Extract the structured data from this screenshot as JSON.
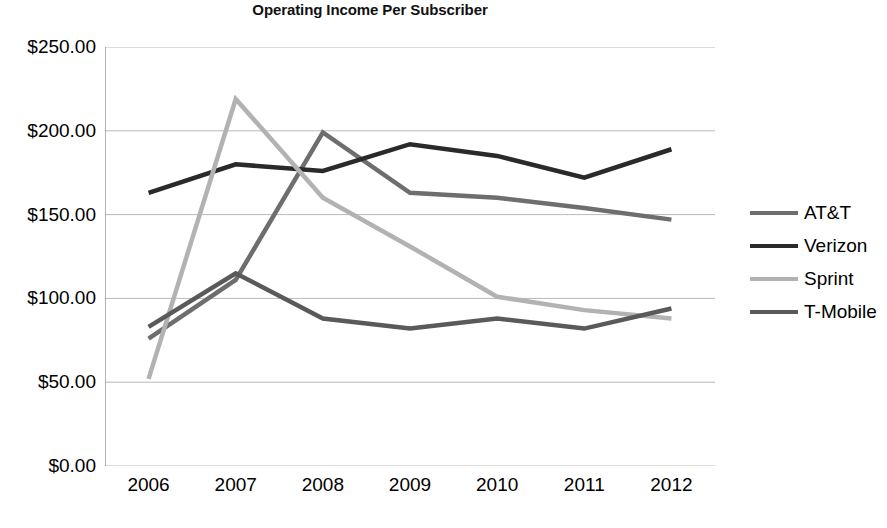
{
  "chart_data": {
    "type": "line",
    "title": "Operating Income Per Subscriber",
    "xlabel": "",
    "ylabel": "",
    "categories": [
      "2006",
      "2007",
      "2008",
      "2009",
      "2010",
      "2011",
      "2012"
    ],
    "x": [
      2006,
      2007,
      2008,
      2009,
      2010,
      2011,
      2012
    ],
    "ylim": [
      0,
      250
    ],
    "ytick_values": [
      0,
      50,
      100,
      150,
      200,
      250
    ],
    "ytick_labels": [
      "$0.00",
      "$50.00",
      "$100.00",
      "$150.00",
      "$200.00",
      "$250.00"
    ],
    "grid": true,
    "legend_position": "right",
    "series": [
      {
        "name": "AT&T",
        "color": "#6e6e6e",
        "values": [
          76,
          111,
          199,
          163,
          160,
          154,
          147
        ]
      },
      {
        "name": "Verizon",
        "color": "#2a2a2a",
        "values": [
          163,
          180,
          176,
          192,
          185,
          172,
          189
        ]
      },
      {
        "name": "Sprint",
        "color": "#b2b2b2",
        "values": [
          52,
          219,
          160,
          131,
          101,
          93,
          88
        ]
      },
      {
        "name": "T-Mobile",
        "color": "#5a5a5a",
        "values": [
          83,
          115,
          88,
          82,
          88,
          82,
          94
        ]
      }
    ]
  },
  "axis": {
    "axis_line_color": "#808080",
    "grid_color": "#b9b9b9"
  },
  "legend": {
    "items": [
      {
        "label": "AT&T"
      },
      {
        "label": "Verizon"
      },
      {
        "label": "Sprint"
      },
      {
        "label": "T-Mobile"
      }
    ]
  }
}
